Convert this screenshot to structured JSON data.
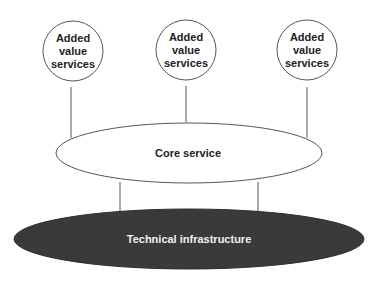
{
  "diagram": {
    "added_value_nodes": [
      {
        "label_lines": [
          "Added",
          "value",
          "services"
        ]
      },
      {
        "label_lines": [
          "Added",
          "value",
          "services"
        ]
      },
      {
        "label_lines": [
          "Added",
          "value",
          "services"
        ]
      }
    ],
    "core": {
      "label": "Core service"
    },
    "infrastructure": {
      "label": "Technical infrastructure"
    },
    "colors": {
      "stroke": "#555555",
      "infrastructure_fill": "#3a3a3a",
      "infrastructure_text": "#f2f2f2",
      "text": "#222222"
    }
  }
}
